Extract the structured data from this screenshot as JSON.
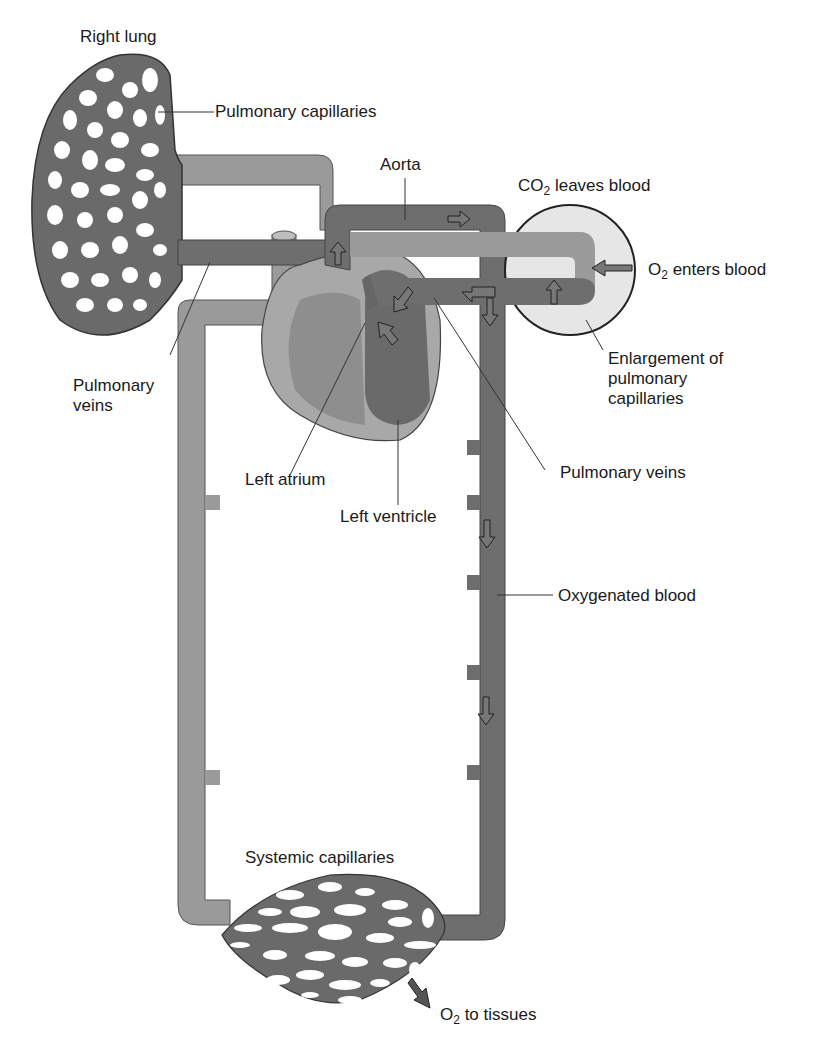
{
  "diagram": {
    "labels": {
      "right_lung": "Right lung",
      "pulmonary_capillaries": "Pulmonary capillaries",
      "aorta": "Aorta",
      "co2_prefix": "CO",
      "co2_sub": "2",
      "co2_suffix": " leaves blood",
      "o2_enters_prefix": "O",
      "o2_enters_sub": "2",
      "o2_enters_suffix": " enters blood",
      "enlargement_line1": "Enlargement of",
      "enlargement_line2": "pulmonary",
      "enlargement_line3": "capillaries",
      "pulmonary_veins_left_line1": "Pulmonary",
      "pulmonary_veins_left_line2": "veins",
      "pulmonary_veins_right": "Pulmonary veins",
      "left_atrium": "Left atrium",
      "left_ventricle": "Left ventricle",
      "oxygenated_blood": "Oxygenated blood",
      "systemic_capillaries": "Systemic capillaries",
      "o2_tissues_prefix": "O",
      "o2_tissues_sub": "2",
      "o2_tissues_suffix": " to tissues"
    },
    "colors": {
      "oxygenated": "#6e6e6e",
      "deoxygenated": "#9a9a9a",
      "heart_wall": "#a8a8a8",
      "enlargement_circle": "#e6e6e6",
      "outline": "#333333"
    }
  }
}
